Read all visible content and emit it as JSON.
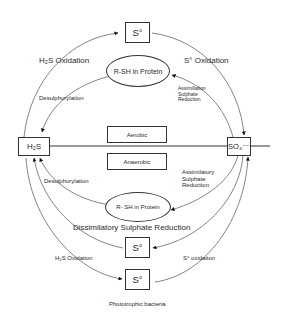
{
  "diagram": {
    "type": "sulfur-cycle",
    "nodes": {
      "s0_top": "S°",
      "h2s": "H₂S",
      "so4": "SO₄⁻⁻",
      "s0_mid": "S°",
      "s0_bottom": "S°",
      "rsh_top": "R-SH in Protein",
      "rsh_bottom": "R- SH in Protein"
    },
    "zones": {
      "aerobic": "Aerobic",
      "anaerobic": "Anaerobic"
    },
    "labels": {
      "h2s_oxidation_top": "H₂S Oxidation",
      "s0_oxidation_top": "S° Oxidation",
      "desulphurylation_top": "Desulphurylation",
      "assimillation_top": "Assimillation\nSulphate\nReduction",
      "desulphurylation_bottom": "Desulphurylation",
      "assimilatory_bottom": "Assimilatory\nSulphate\nReduction",
      "dissimilatory": "Dissimilatory Sulphate Reduction",
      "h2s_oxidation_bottom": "H₂S Oxidation",
      "s0_oxidation_bottom": "S° oxidation",
      "phototrophic": "Phototrophic bacteria"
    },
    "edges": [
      {
        "from": "H₂S",
        "to": "S° (top)",
        "label": "H₂S Oxidation"
      },
      {
        "from": "S° (top)",
        "to": "SO₄⁻⁻",
        "label": "S° Oxidation"
      },
      {
        "from": "R-SH in Protein (top)",
        "to": "H₂S",
        "label": "Desulphurylation"
      },
      {
        "from": "SO₄⁻⁻",
        "to": "R-SH in Protein (top)",
        "label": "Assimillation Sulphate Reduction"
      },
      {
        "from": "R- SH in Protein (bottom)",
        "to": "H₂S",
        "label": "Desulphurylation"
      },
      {
        "from": "SO₄⁻⁻",
        "to": "R- SH in Protein (bottom)",
        "label": "Assimilatory Sulphate Reduction"
      },
      {
        "from": "SO₄⁻⁻",
        "to": "S° (mid)",
        "label": "Dissimilatory Sulphate Reduction"
      },
      {
        "from": "S° (mid)",
        "to": "H₂S",
        "label": "Dissimilatory Sulphate Reduction"
      },
      {
        "from": "H₂S",
        "to": "S° (bottom)",
        "label": "H₂S Oxidation"
      },
      {
        "from": "S° (bottom)",
        "to": "SO₄⁻⁻",
        "label": "S° oxidation"
      }
    ],
    "colors": {
      "line": "#555555",
      "text": "#2a2a2a",
      "background": "#ffffff"
    }
  }
}
